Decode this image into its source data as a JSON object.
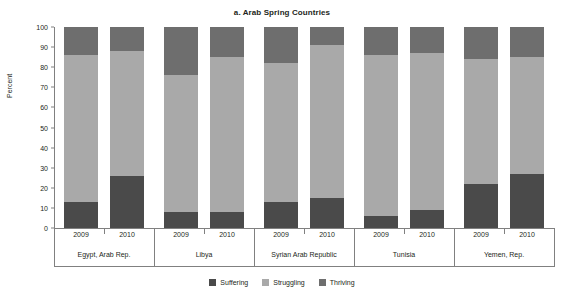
{
  "chart_data": {
    "type": "bar",
    "stacked": true,
    "title": "a. Arab Spring Countries",
    "xlabel": "",
    "ylabel": "Percent",
    "ylim": [
      0,
      100
    ],
    "yticks": [
      0,
      10,
      20,
      30,
      40,
      50,
      60,
      70,
      80,
      90,
      100
    ],
    "grid": false,
    "legend_position": "bottom-center",
    "groups": [
      {
        "country": "Egypt, Arab Rep.",
        "years": [
          "2009",
          "2010"
        ]
      },
      {
        "country": "Libya",
        "years": [
          "2009",
          "2010"
        ]
      },
      {
        "country": "Syrian Arab Republic",
        "years": [
          "2009",
          "2010"
        ]
      },
      {
        "country": "Tunisia",
        "years": [
          "2009",
          "2010"
        ]
      },
      {
        "country": "Yemen, Rep.",
        "years": [
          "2009",
          "2010"
        ]
      }
    ],
    "categories": [
      "Egypt, Arab Rep. 2009",
      "Egypt, Arab Rep. 2010",
      "Libya 2009",
      "Libya 2010",
      "Syrian Arab Republic 2009",
      "Syrian Arab Republic 2010",
      "Tunisia 2009",
      "Tunisia 2010",
      "Yemen, Rep. 2009",
      "Yemen, Rep. 2010"
    ],
    "series": [
      {
        "name": "Suffering",
        "color": "#4a4a4a",
        "values": [
          13,
          26,
          8,
          8,
          13,
          15,
          6,
          9,
          22,
          27
        ]
      },
      {
        "name": "Struggling",
        "color": "#a9a9a9",
        "values": [
          73,
          62,
          68,
          77,
          69,
          76,
          80,
          78,
          62,
          58
        ]
      },
      {
        "name": "Thriving",
        "color": "#6e6e6e",
        "values": [
          14,
          12,
          24,
          15,
          18,
          9,
          14,
          13,
          16,
          15
        ]
      }
    ],
    "legend": [
      "Suffering",
      "Struggling",
      "Thriving"
    ]
  }
}
